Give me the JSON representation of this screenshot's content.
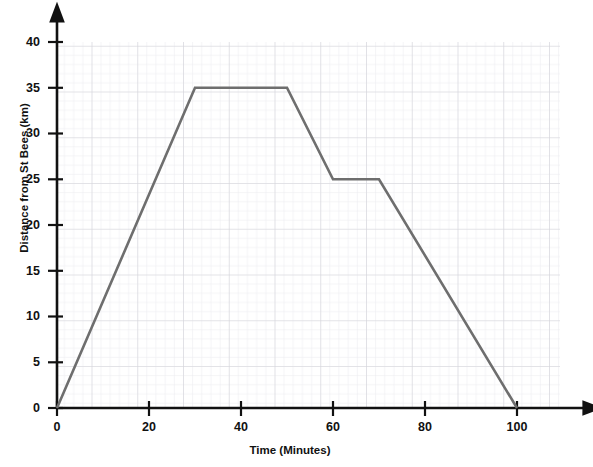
{
  "figure": {
    "cut_off_header": "",
    "background": "#ffffff"
  },
  "chart_data": {
    "type": "line",
    "title": "",
    "xlabel": "Time (Minutes)",
    "ylabel": "Distance from St Bees (km)",
    "xlim": [
      0,
      100
    ],
    "ylim": [
      0,
      40
    ],
    "xticks": [
      0,
      20,
      40,
      60,
      80,
      100
    ],
    "yticks": [
      0,
      5,
      10,
      15,
      20,
      25,
      30,
      35,
      40
    ],
    "grid": true,
    "grid_minor_step_x": 2,
    "grid_minor_step_y": 1,
    "grid_major_step_x": 10,
    "grid_major_step_y": 5,
    "legend": null,
    "series": [
      {
        "name": "Journey",
        "color": "#6e6e6e",
        "x": [
          0,
          30,
          50,
          60,
          70,
          100
        ],
        "y": [
          0,
          35,
          35,
          25,
          25,
          0
        ],
        "points": [
          {
            "x": 0,
            "y": 0,
            "note": "start at St Bees"
          },
          {
            "x": 30,
            "y": 35,
            "note": "arrives 35 km"
          },
          {
            "x": 50,
            "y": 35,
            "note": "stationary 30-50 min"
          },
          {
            "x": 60,
            "y": 25,
            "note": "returns to 25 km"
          },
          {
            "x": 70,
            "y": 25,
            "note": "stationary 60-70 min"
          },
          {
            "x": 100,
            "y": 0,
            "note": "back at St Bees"
          }
        ]
      }
    ],
    "colors": {
      "line": "#6e6e6e",
      "axis": "#111111",
      "grid_minor": "#e9e9ee",
      "grid_major": "#d2d2d8",
      "text": "#111111"
    }
  },
  "axis_ticks": {
    "y": [
      "0",
      "5",
      "10",
      "15",
      "20",
      "25",
      "30",
      "35",
      "40"
    ],
    "x": [
      "0",
      "20",
      "40",
      "60",
      "80",
      "100"
    ]
  }
}
